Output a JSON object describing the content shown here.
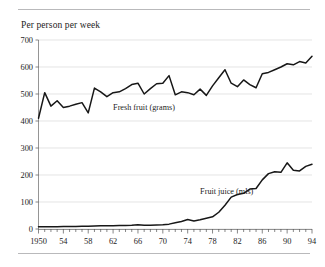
{
  "chart_data": {
    "type": "line",
    "title": "Per person per week",
    "xlabel": "",
    "ylabel": "",
    "xlim": [
      1950,
      1994
    ],
    "ylim": [
      0,
      700
    ],
    "yticks": [
      0,
      100,
      200,
      300,
      400,
      500,
      600,
      700
    ],
    "ytick_labels": [
      "0",
      "100",
      "200",
      "300",
      "400",
      "500",
      "600",
      "700"
    ],
    "xticks": [
      1950,
      1954,
      1958,
      1962,
      1966,
      1970,
      1974,
      1978,
      1982,
      1986,
      1990,
      1994
    ],
    "xtick_labels": [
      "1950",
      "54",
      "58",
      "62",
      "66",
      "70",
      "74",
      "78",
      "82",
      "86",
      "90",
      "94"
    ],
    "minor_xticks_every": 1,
    "grid": "horizontal",
    "legend": "inline-annotations",
    "x": [
      1950,
      1951,
      1952,
      1953,
      1954,
      1955,
      1956,
      1957,
      1958,
      1959,
      1960,
      1961,
      1962,
      1963,
      1964,
      1965,
      1966,
      1967,
      1968,
      1969,
      1970,
      1971,
      1972,
      1973,
      1974,
      1975,
      1976,
      1977,
      1978,
      1979,
      1980,
      1981,
      1982,
      1983,
      1984,
      1985,
      1986,
      1987,
      1988,
      1989,
      1990,
      1991,
      1992,
      1993,
      1994
    ],
    "series": [
      {
        "name": "Fresh fruit (grams)",
        "unit": "grams",
        "label_x": 1962,
        "label_y": 440,
        "values": [
          410,
          505,
          455,
          475,
          450,
          455,
          462,
          468,
          430,
          522,
          508,
          490,
          505,
          508,
          520,
          535,
          540,
          500,
          520,
          538,
          540,
          568,
          497,
          508,
          505,
          497,
          518,
          495,
          530,
          560,
          590,
          540,
          527,
          552,
          535,
          523,
          575,
          580,
          590,
          600,
          612,
          608,
          620,
          615,
          640
        ]
      },
      {
        "name": "Fruit juice (mls)",
        "unit": "mls",
        "label_x": 1976,
        "label_y": 130,
        "values": [
          8,
          8,
          8,
          8,
          9,
          9,
          9,
          10,
          10,
          11,
          12,
          12,
          12,
          13,
          13,
          14,
          16,
          14,
          14,
          15,
          16,
          18,
          23,
          28,
          35,
          30,
          34,
          40,
          45,
          62,
          88,
          118,
          128,
          132,
          148,
          150,
          182,
          205,
          212,
          210,
          245,
          218,
          215,
          232,
          240
        ]
      }
    ],
    "annotations": [
      {
        "text": "Fresh fruit (grams)",
        "x": 1962,
        "y": 440
      },
      {
        "text": "Fruit juice (mls)",
        "x": 1976,
        "y": 130
      }
    ]
  },
  "figure": {
    "top_rule": "horizontal-rule",
    "bottom_rule": "horizontal-rule",
    "background_color": "#ffffff",
    "line_color": "#171717",
    "grid_color": "#d8d8d8"
  }
}
